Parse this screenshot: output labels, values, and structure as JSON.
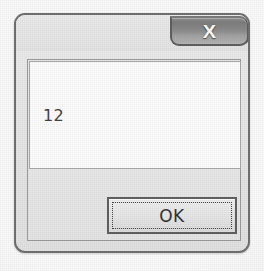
{
  "window": {
    "title": "",
    "close_button": {
      "icon": "close-icon",
      "glyph": "✕",
      "label": "X"
    }
  },
  "content": {
    "message_value": "12"
  },
  "footer": {
    "ok_label": "OK"
  },
  "colors": {
    "window_background": "#e9e9e9",
    "window_border": "#6d6d6d",
    "message_area_background": "#fdfdfd",
    "message_text": "#3c3c3c",
    "close_button_dark": "#7b7b7b",
    "close_button_light": "#b2b2b2",
    "close_icon": "#fdfdfd",
    "button_face": "#e6e6e6",
    "button_border": "#5d5d5d",
    "focus_ring": "#3b3b3b",
    "page_background": "#fbfbfb"
  }
}
